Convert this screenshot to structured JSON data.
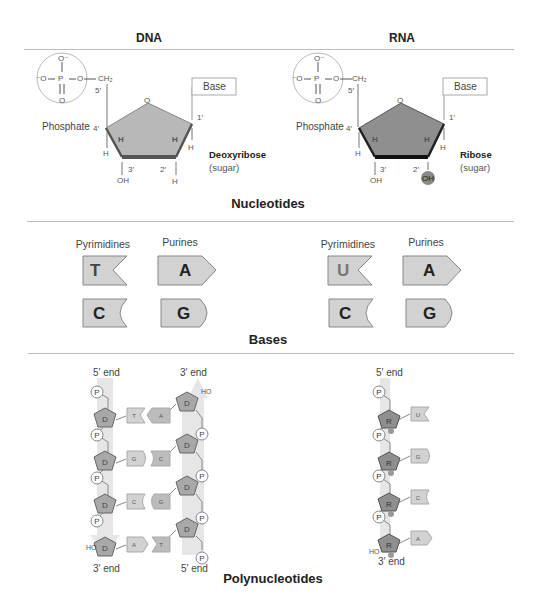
{
  "columns": {
    "left": "DNA",
    "right": "RNA"
  },
  "sections": {
    "nucleotides": "Nucleotides",
    "bases": "Bases",
    "polynucleotides": "Polynucleotides"
  },
  "nucleotides": {
    "dna": {
      "phosphate": {
        "o_top": "O⁻",
        "o_left": "⁻O",
        "p": "P",
        "o_right": "O",
        "o_bottom": "O",
        "ch2": "CH₂",
        "label": "Phosphate"
      },
      "base_box": "Base",
      "ring_oxygen": "O",
      "positions": {
        "c1": "1′",
        "c2": "2′",
        "c3": "3′",
        "c4": "4′",
        "c5": "5′"
      },
      "substituents": {
        "h4": "H",
        "h3_top": "H",
        "oh3": "OH",
        "h2_top": "H",
        "h2_bottom": "H",
        "h1": "H"
      },
      "sugar_name": "Deoxyribose",
      "sugar_sub": "(sugar)"
    },
    "rna": {
      "phosphate": {
        "o_top": "O⁻",
        "o_left": "⁻O",
        "p": "P",
        "o_right": "O",
        "o_bottom": "O",
        "ch2": "CH₂",
        "label": "Phosphate"
      },
      "base_box": "Base",
      "ring_oxygen": "O",
      "positions": {
        "c1": "1′",
        "c2": "2′",
        "c3": "3′",
        "c4": "4′",
        "c5": "5′"
      },
      "substituents": {
        "h4": "H",
        "h3_top": "H",
        "oh3": "OH",
        "h2_top": "H",
        "oh2": "OH",
        "h1": "H"
      },
      "sugar_name": "Ribose",
      "sugar_sub": "(sugar)"
    }
  },
  "bases": {
    "dna": {
      "pyrimidines_label": "Pyrimidines",
      "purines_label": "Purines",
      "pyrimidines": [
        "T",
        "C"
      ],
      "purines": [
        "A",
        "G"
      ]
    },
    "rna": {
      "pyrimidines_label": "Pyrimidines",
      "purines_label": "Purines",
      "pyrimidines": [
        "U",
        "C"
      ],
      "purines": [
        "A",
        "G"
      ]
    }
  },
  "polynucleotides": {
    "dna": {
      "left_top": "5′ end",
      "left_bottom": "3′ end",
      "right_top": "3′ end",
      "right_bottom": "5′ end",
      "sugar": "D",
      "phosphate": "P",
      "ho": "HO",
      "pairs": [
        [
          "T",
          "A"
        ],
        [
          "G",
          "C"
        ],
        [
          "C",
          "G"
        ],
        [
          "A",
          "T"
        ]
      ]
    },
    "rna": {
      "top": "5′ end",
      "bottom": "3′ end",
      "sugar": "R",
      "phosphate": "P",
      "ho": "HO",
      "bases": [
        "U",
        "G",
        "C",
        "A"
      ]
    }
  },
  "colors": {
    "dna_sugar": "#b8b8b8",
    "rna_sugar": "#8f8f8f",
    "base_fill": "#d2d2d2",
    "rule": "#bdbdbd",
    "strand_band": "#e6e6e6"
  }
}
